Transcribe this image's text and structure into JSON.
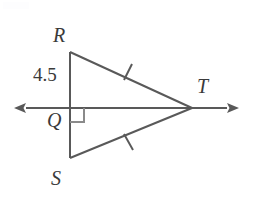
{
  "figure": {
    "type": "geometry-diagram",
    "background_color": "#ffffff",
    "stroke_color": "#595959",
    "text_color": "#3a3a3a",
    "labels": {
      "R": "R",
      "Q": "Q",
      "S": "S",
      "T": "T",
      "segment_RQ_measure": "4.5"
    },
    "points": {
      "R": {
        "x": 70,
        "y": 52
      },
      "Q": {
        "x": 70,
        "y": 108
      },
      "S": {
        "x": 70,
        "y": 158
      },
      "T": {
        "x": 192,
        "y": 108
      }
    },
    "line_through_Q_and_T": {
      "left_arrow_tip": {
        "x": 13,
        "y": 108
      },
      "right_arrow_tip": {
        "x": 240,
        "y": 108
      },
      "double_headed": true
    },
    "right_angle_marker": {
      "at": "Q",
      "size": 14,
      "opens": "down-right"
    },
    "congruence_ticks": [
      {
        "on_segment": "RT",
        "count": 1,
        "x": 128,
        "y": 72
      },
      {
        "on_segment": "ST",
        "count": 1,
        "x": 129,
        "y": 142
      }
    ]
  }
}
